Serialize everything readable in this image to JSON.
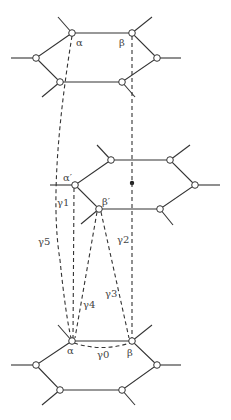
{
  "diagram": {
    "labels": {
      "top_alpha": "α",
      "top_beta": "β",
      "mid_alpha": "α′",
      "mid_beta": "β′",
      "bot_alpha": "α",
      "bot_beta": "β",
      "gamma0": "γ0",
      "gamma1": "γ1",
      "gamma2": "γ2",
      "gamma3": "γ3",
      "gamma4": "γ4",
      "gamma5": "γ5"
    },
    "colors": {
      "line": "#333333",
      "text": "#444444",
      "background": "#ffffff"
    }
  }
}
